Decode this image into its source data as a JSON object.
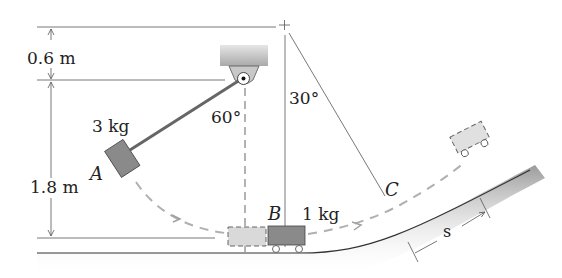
{
  "diagram": {
    "type": "mechanics-problem",
    "labels": {
      "dim_top": "0.6 m",
      "dim_height": "1.8 m",
      "mass_a": "3 kg",
      "point_a": "A",
      "angle_pendulum": "60°",
      "angle_c": "30°",
      "point_b": "B",
      "mass_b": "1 kg",
      "point_c": "C",
      "distance_s": "s"
    },
    "colors": {
      "line": "#555555",
      "block": "#8a8a8a",
      "ghost": "#d9d9d9",
      "dash": "#b0b0b0",
      "ground": "#9a9a9a",
      "ceiling": "#bdbdbd"
    }
  }
}
